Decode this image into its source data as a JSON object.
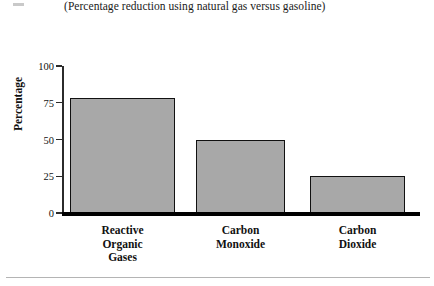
{
  "subtitle": "(Percentage reduction using natural gas versus gasoline)",
  "colors": {
    "bar_fill": "#a8a8a8",
    "bar_outline": "#111111",
    "axis": "#2b2b2b",
    "baseline": "#000000",
    "background": "#ffffff",
    "footer_rule": "#b4b4b4"
  },
  "chart_data": {
    "type": "bar",
    "title": "",
    "subtitle": "(Percentage reduction using natural gas versus gasoline)",
    "categories": [
      "Reactive Organic Gases",
      "Carbon Monoxide",
      "Carbon Dioxide"
    ],
    "category_lines": [
      [
        "Reactive",
        "Organic",
        "Gases"
      ],
      [
        "Carbon",
        "Monoxide"
      ],
      [
        "Carbon",
        "Dioxide"
      ]
    ],
    "values": [
      78,
      50,
      25
    ],
    "xlabel": "",
    "ylabel": "Percentage",
    "ylim": [
      0,
      100
    ],
    "yticks": [
      0,
      25,
      50,
      75,
      100
    ],
    "ytick_labels": [
      "0",
      "25",
      "50",
      "75",
      "100"
    ],
    "grid": false,
    "legend": false
  }
}
